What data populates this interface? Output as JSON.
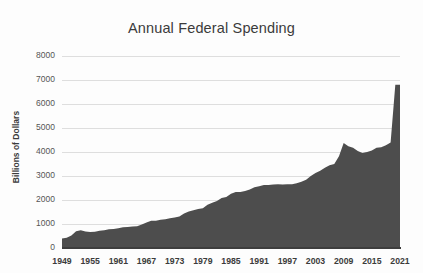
{
  "chart_data": {
    "type": "area",
    "title": "Annual Federal Spending",
    "xlabel": "",
    "ylabel": "Billions of Dollars",
    "ylim": [
      0,
      8000
    ],
    "xlim": [
      1949,
      2021
    ],
    "grid": true,
    "legend": false,
    "fill_color": "#4d4d4d",
    "gridline_color": "#dedede",
    "ytick_labels": [
      "8000",
      "7000",
      "6000",
      "5000",
      "4000",
      "3000",
      "2000",
      "1000",
      "0"
    ],
    "ytick_values": [
      8000,
      7000,
      6000,
      5000,
      4000,
      3000,
      2000,
      1000,
      0
    ],
    "xtick_labels": [
      "1949",
      "1955",
      "1961",
      "1967",
      "1973",
      "1979",
      "1985",
      "1991",
      "1997",
      "2003",
      "2009",
      "2015",
      "2021"
    ],
    "xtick_values": [
      1949,
      1955,
      1961,
      1967,
      1973,
      1979,
      1985,
      1991,
      1997,
      2003,
      2009,
      2015,
      2021
    ],
    "x": [
      1949,
      1950,
      1951,
      1952,
      1953,
      1954,
      1955,
      1956,
      1957,
      1958,
      1959,
      1960,
      1961,
      1962,
      1963,
      1964,
      1965,
      1966,
      1967,
      1968,
      1969,
      1970,
      1971,
      1972,
      1973,
      1974,
      1975,
      1976,
      1977,
      1978,
      1979,
      1980,
      1981,
      1982,
      1983,
      1984,
      1985,
      1986,
      1987,
      1988,
      1989,
      1990,
      1991,
      1992,
      1993,
      1994,
      1995,
      1996,
      1997,
      1998,
      1999,
      2000,
      2001,
      2002,
      2003,
      2004,
      2005,
      2006,
      2007,
      2008,
      2009,
      2010,
      2011,
      2012,
      2013,
      2014,
      2015,
      2016,
      2017,
      2018,
      2019,
      2020,
      2021
    ],
    "values": [
      400,
      430,
      520,
      700,
      740,
      690,
      670,
      680,
      720,
      740,
      780,
      790,
      820,
      860,
      880,
      900,
      910,
      980,
      1060,
      1140,
      1140,
      1180,
      1200,
      1240,
      1270,
      1310,
      1440,
      1520,
      1570,
      1620,
      1660,
      1800,
      1890,
      1960,
      2080,
      2120,
      2260,
      2330,
      2330,
      2380,
      2440,
      2530,
      2570,
      2620,
      2620,
      2650,
      2660,
      2650,
      2660,
      2660,
      2700,
      2760,
      2840,
      3000,
      3120,
      3220,
      3340,
      3450,
      3500,
      3820,
      4380,
      4240,
      4180,
      4040,
      3960,
      4000,
      4060,
      4180,
      4200,
      4280,
      4400,
      6800,
      6800
    ],
    "series_name": "Annual Federal Spending"
  }
}
